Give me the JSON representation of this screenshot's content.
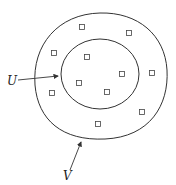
{
  "diagram": {
    "labels": {
      "inner_set": "U",
      "outer_set": "V"
    },
    "point_count": 11,
    "colors": {
      "stroke": "#333333",
      "background": "#ffffff"
    }
  }
}
